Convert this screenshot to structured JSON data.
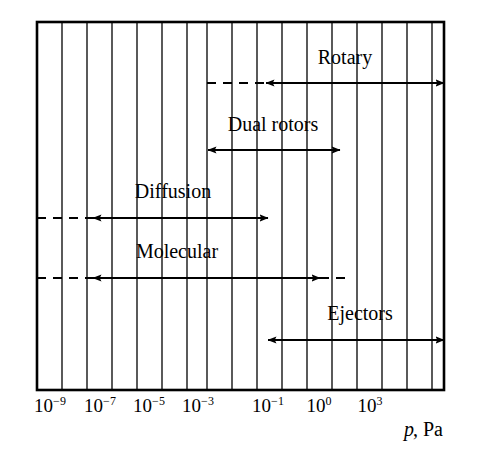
{
  "figure": {
    "title": "",
    "axis": {
      "label_italic": "p",
      "label_roman": ", Pa",
      "ticks": [
        {
          "mantissa": "10",
          "exponent": "−9",
          "x": 50
        },
        {
          "mantissa": "10",
          "exponent": "−7",
          "x": 100
        },
        {
          "mantissa": "10",
          "exponent": "−5",
          "x": 149
        },
        {
          "mantissa": "10",
          "exponent": "−3",
          "x": 198
        },
        {
          "mantissa": "10",
          "exponent": "−1",
          "x": 268
        },
        {
          "mantissa": "10",
          "exponent": "0",
          "x": 319
        },
        {
          "mantissa": "10",
          "exponent": "3",
          "x": 370
        }
      ]
    },
    "plot_box": {
      "left": 37,
      "right": 444,
      "top": 22,
      "bottom": 390,
      "gridline_xs": [
        62,
        87,
        112,
        137,
        162,
        187,
        207,
        232,
        257,
        282,
        307,
        332,
        357,
        382,
        407,
        432
      ]
    },
    "bands": [
      {
        "name": "Rotary",
        "label": "Rotary",
        "label_x": 345,
        "label_y": 64,
        "y": 83,
        "dashed_start": 207,
        "solid_start": 266,
        "solid_end": 444,
        "arrow_left": true,
        "arrow_right": true,
        "dashed_end": 444
      },
      {
        "name": "Dual rotors",
        "label": "Dual rotors",
        "label_x": 273,
        "label_y": 131,
        "y": 150,
        "dashed_start": null,
        "solid_start": 208,
        "solid_end": 340,
        "arrow_left": true,
        "arrow_right": true,
        "dashed_end": null
      },
      {
        "name": "Diffusion",
        "label": "Diffusion",
        "label_x": 173,
        "label_y": 198,
        "y": 218,
        "dashed_start": 37,
        "solid_start": 93,
        "solid_end": 268,
        "arrow_left": true,
        "arrow_right": true,
        "dashed_end": null
      },
      {
        "name": "Molecular",
        "label": "Molecular",
        "label_x": 177,
        "label_y": 258,
        "y": 278,
        "dashed_start": 37,
        "solid_start": 93,
        "solid_end": 320,
        "arrow_left": true,
        "arrow_right": true,
        "dashed_end": 347
      },
      {
        "name": "Ejectors",
        "label": "Ejectors",
        "label_x": 360,
        "label_y": 320,
        "y": 340,
        "dashed_start": null,
        "solid_start": 268,
        "solid_end": 444,
        "arrow_left": true,
        "arrow_right": true,
        "dashed_end": null
      }
    ]
  },
  "chart_data": {
    "type": "bar",
    "xlabel": "p, Pa",
    "ylabel": "",
    "xscale": "log",
    "grid": true,
    "legend": "none",
    "xlim": [
      -10,
      6
    ],
    "xticks": [
      -9,
      -7,
      -5,
      -3,
      -1,
      0,
      3
    ],
    "xticklabels": [
      "10−9",
      "10−7",
      "10−5",
      "10−3",
      "10−1",
      "10⁰",
      "10³"
    ],
    "categories": [
      "Rotary",
      "Dual rotors",
      "Diffusion",
      "Molecular",
      "Ejectors"
    ],
    "series": [
      {
        "name": "Rotary",
        "range_exponents": [
          -1.0,
          5.5
        ],
        "extension_exponents": [
          -2.5,
          -1.0
        ],
        "extension_style": "dashed",
        "solid_style": "double-arrow"
      },
      {
        "name": "Dual rotors",
        "range_exponents": [
          -2.4,
          1.9
        ],
        "extension_exponents": null,
        "extension_style": "none",
        "solid_style": "double-arrow"
      },
      {
        "name": "Diffusion",
        "range_exponents": [
          -7.7,
          -1.0
        ],
        "extension_exponents": [
          -9.5,
          -7.7
        ],
        "extension_style": "dashed",
        "solid_style": "double-arrow"
      },
      {
        "name": "Molecular",
        "range_exponents": [
          -7.7,
          0.7
        ],
        "extension_exponents": [
          -9.5,
          -7.7,
          0.7,
          1.6
        ],
        "extension_style": "dashed",
        "solid_style": "double-arrow"
      },
      {
        "name": "Ejectors",
        "range_exponents": [
          -1.0,
          5.5
        ],
        "extension_exponents": null,
        "extension_style": "none",
        "solid_style": "double-arrow"
      }
    ]
  }
}
